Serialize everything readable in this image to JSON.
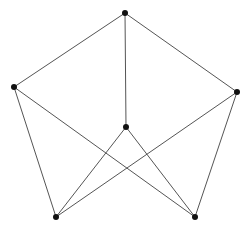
{
  "diagram": {
    "type": "graph",
    "nodes": [
      {
        "id": "top",
        "x": 125,
        "y": 13
      },
      {
        "id": "left",
        "x": 14,
        "y": 87
      },
      {
        "id": "right",
        "x": 237,
        "y": 92
      },
      {
        "id": "center",
        "x": 126,
        "y": 127
      },
      {
        "id": "bottom-left",
        "x": 56,
        "y": 217
      },
      {
        "id": "bottom-right",
        "x": 195,
        "y": 217
      }
    ],
    "edges": [
      [
        "top",
        "left"
      ],
      [
        "top",
        "right"
      ],
      [
        "top",
        "center"
      ],
      [
        "left",
        "bottom-left"
      ],
      [
        "left",
        "bottom-right"
      ],
      [
        "right",
        "bottom-left"
      ],
      [
        "right",
        "bottom-right"
      ],
      [
        "center",
        "bottom-left"
      ],
      [
        "center",
        "bottom-right"
      ]
    ],
    "colors": {
      "edge": "#555555",
      "node": "#111111",
      "background": "#ffffff"
    },
    "node_radius": 3
  }
}
